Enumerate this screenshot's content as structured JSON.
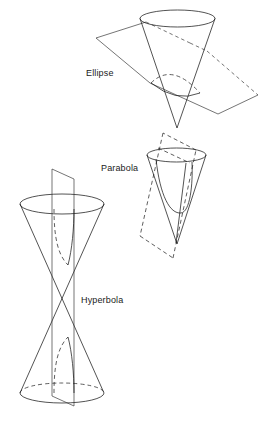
{
  "figure": {
    "background_color": "#ffffff",
    "line_color": "#1a1a1a",
    "sections": [
      {
        "id": "ellipse",
        "label": "Ellipse",
        "cone": "single cone, apex downward",
        "plane": "oblique plane cutting entirely through one nappe",
        "curve": "closed ellipse"
      },
      {
        "id": "parabola",
        "label": "Parabola",
        "cone": "single cone, apex downward",
        "plane": "plane parallel to one generating line, drawn dashed",
        "curve": "open parabola"
      },
      {
        "id": "hyperbola",
        "label": "Hyperbola",
        "cone": "double cone, apex to apex",
        "plane": "vertical plane cutting both nappes",
        "curve": "two hyperbola branches"
      }
    ]
  },
  "labels": {
    "ellipse": "Ellipse",
    "parabola": "Parabola",
    "hyperbola": "Hyperbola"
  }
}
